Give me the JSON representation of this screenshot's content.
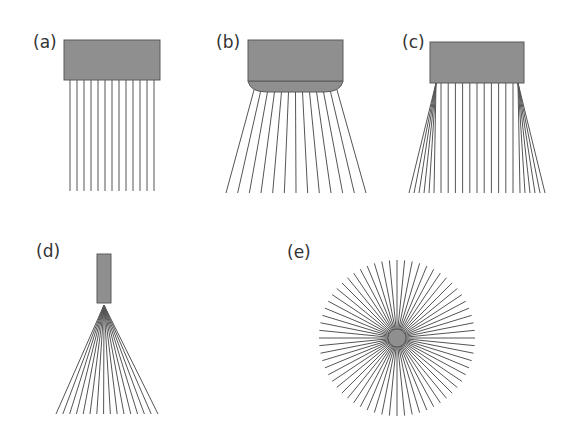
{
  "figure": {
    "colors": {
      "box_fill": "#8f8f8f",
      "box_stroke": "#5a5a5a",
      "ray": "#555555",
      "background": "#ffffff"
    },
    "panels": [
      {
        "id": "a",
        "label": "(a)",
        "label_pos": [
          33,
          48
        ],
        "description": "Rectangular source emitting parallel (collimated) rays",
        "box": {
          "x": 64,
          "y": 40,
          "w": 96,
          "h": 40
        },
        "rays": {
          "type": "parallel",
          "count": 13,
          "x_start": 70,
          "x_end": 154,
          "y_top": 80,
          "y_bottom": 191
        }
      },
      {
        "id": "b",
        "label": "(b)",
        "label_pos": [
          216,
          48
        ],
        "description": "Rectangular source with diverging lens; rays fan outward",
        "box": {
          "x": 248,
          "y": 40,
          "w": 95,
          "h": 41
        },
        "lens": {
          "cx": 295.5,
          "y": 81,
          "rx": 47.5,
          "bulge": 11
        },
        "rays": {
          "type": "diverging",
          "count": 13,
          "top_x_start": 254,
          "top_x_end": 337,
          "top_y": 90,
          "bottom_x_start": 226,
          "bottom_x_end": 366,
          "bottom_y": 193
        }
      },
      {
        "id": "c",
        "label": "(c)",
        "label_pos": [
          402,
          48
        ],
        "description": "Rectangular source with parallel central rays and diverging edge fans",
        "box": {
          "x": 430,
          "y": 42,
          "w": 94,
          "h": 41
        },
        "rays": {
          "type": "mixed",
          "center": {
            "count": 11,
            "x_start": 441,
            "x_end": 513,
            "y_top": 83,
            "y_bottom": 193
          },
          "left_fan": {
            "count": 6,
            "origin": [
              436,
              83
            ],
            "bottom_x_start": 409,
            "bottom_x_end": 434,
            "bottom_y": 193
          },
          "right_fan": {
            "count": 6,
            "origin": [
              518,
              83
            ],
            "bottom_x_start": 520,
            "bottom_x_end": 545,
            "bottom_y": 193
          }
        }
      },
      {
        "id": "d",
        "label": "(d)",
        "label_pos": [
          36,
          257
        ],
        "description": "Narrow source with rays diverging from a single point",
        "box": {
          "x": 97,
          "y": 254,
          "w": 14,
          "h": 49
        },
        "rays": {
          "type": "point_fan",
          "count": 16,
          "origin": [
            104,
            305
          ],
          "bottom_x_start": 56,
          "bottom_x_end": 158,
          "bottom_y": 414
        }
      },
      {
        "id": "e",
        "label": "(e)",
        "label_pos": [
          287,
          258
        ],
        "description": "Isotropic point source radiating in all directions",
        "source": {
          "cx": 397,
          "cy": 338,
          "r": 9
        },
        "rays": {
          "type": "radial",
          "count": 64,
          "radius": 78
        }
      }
    ]
  }
}
